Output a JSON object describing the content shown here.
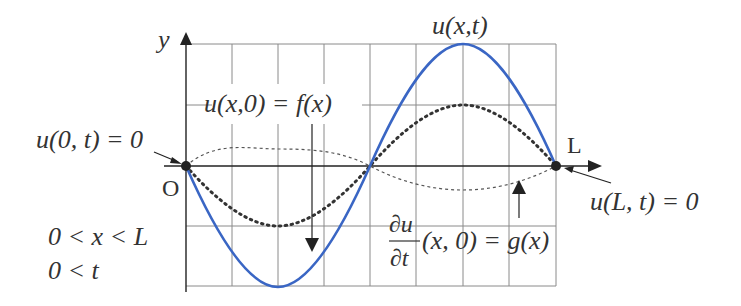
{
  "figure": {
    "type": "wave-equation-diagram",
    "colors": {
      "solution_curve": "#3a66c4",
      "grid": "#8a8a8a",
      "axis": "#222222",
      "text": "#333333",
      "dotted_curve": "#333333",
      "dashed_curve": "#555555"
    },
    "axes": {
      "y_label": "y",
      "origin_label": "O",
      "end_label": "L"
    },
    "labels": {
      "solution": "u(x,t)",
      "initial_displacement": "u(x,0) = f(x)",
      "boundary_left": "u(0, t) = 0",
      "boundary_right": "u(L, t) = 0",
      "initial_velocity_num": "∂u",
      "initial_velocity_den": "∂t",
      "initial_velocity_rest": "(x, 0) = g(x)",
      "domain_x": "0 < x < L",
      "domain_t": "0 < t"
    },
    "curves": [
      {
        "name": "u(x,t)",
        "style": "solid",
        "shape": "-sin(2πx/L)",
        "amplitude": 2
      },
      {
        "name": "f(x)",
        "style": "dotted",
        "shape": "-sin(2πx/L)",
        "amplitude": 1
      },
      {
        "name": "g(x)",
        "style": "dashed",
        "shape": "sin(2πx/L)",
        "amplitude": 0.35
      }
    ],
    "grid": {
      "columns": 8,
      "rows": 4
    }
  }
}
